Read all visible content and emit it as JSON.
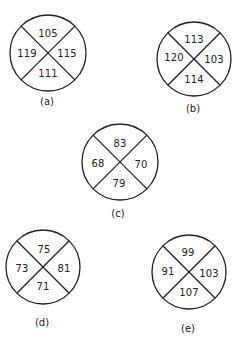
{
  "figures": [
    {
      "label": "(a)",
      "top": "105",
      "right": "115",
      "bottom": "111",
      "left": "119"
    },
    {
      "label": "(b)",
      "top": "113",
      "right": "103",
      "bottom": "114",
      "left": "120"
    },
    {
      "label": "(c)",
      "top": "83",
      "right": "70",
      "bottom": "79",
      "left": "68"
    },
    {
      "label": "(d)",
      "top": "75",
      "right": "81",
      "bottom": "71",
      "left": "73"
    },
    {
      "label": "(e)",
      "top": "99",
      "right": "103",
      "bottom": "107",
      "left": "91"
    }
  ]
}
